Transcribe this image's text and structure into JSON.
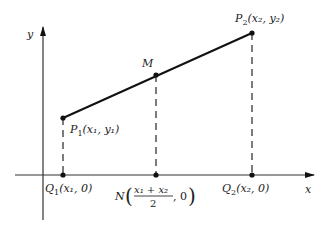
{
  "diagram": {
    "type": "coordinate-geometry",
    "axes": {
      "x_label": "x",
      "y_label": "y"
    },
    "points": [
      {
        "id": "P1",
        "name": "P",
        "sub": "1",
        "coords": "(x₁, y₁)",
        "label": "P1(x1, y1)",
        "px": [
          63,
          118
        ]
      },
      {
        "id": "M",
        "name": "M",
        "label": "M",
        "px": [
          156,
          75
        ]
      },
      {
        "id": "P2",
        "name": "P",
        "sub": "2",
        "coords": "(x₂, y₂)",
        "label": "P2(x2, y2)",
        "px": [
          252,
          33
        ]
      },
      {
        "id": "Q1",
        "name": "Q",
        "sub": "1",
        "coords": "(x₁, 0)",
        "label": "Q1(x1, 0)",
        "px": [
          63,
          175
        ]
      },
      {
        "id": "N",
        "name": "N",
        "label": "N((x1 + x2)/2, 0)",
        "numerator": "x₁ + x₂",
        "denominator": "2",
        "tail": ", 0",
        "px": [
          156,
          175
        ]
      },
      {
        "id": "Q2",
        "name": "Q",
        "sub": "2",
        "coords": "(x₂, 0)",
        "label": "Q2(x2, 0)",
        "px": [
          252,
          175
        ]
      }
    ],
    "segments": [
      {
        "from": "P1",
        "to": "P2",
        "style": "solid"
      },
      {
        "from": "P1",
        "to": "Q1",
        "style": "dashed"
      },
      {
        "from": "M",
        "to": "N",
        "style": "dashed"
      },
      {
        "from": "P2",
        "to": "Q2",
        "style": "dashed"
      }
    ],
    "colors": {
      "ink": "#111111",
      "axis": "#333333",
      "background": "#ffffff"
    }
  }
}
